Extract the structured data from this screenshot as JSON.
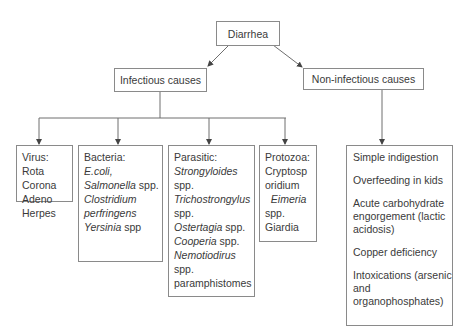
{
  "root": {
    "label": "Diarrhea"
  },
  "branches": {
    "infectious": {
      "label": "Infectious causes"
    },
    "non_infectious": {
      "label": "Non-infectious causes"
    }
  },
  "infectious_groups": {
    "virus": {
      "title": "Virus:",
      "items": [
        "Rota",
        "Corona",
        "Adeno",
        "Herpes"
      ]
    },
    "bacteria": {
      "title": "Bacteria:",
      "lines": [
        {
          "italic": "E.coli,",
          "plain": ""
        },
        {
          "italic": "Salmonella",
          "plain": " spp."
        },
        {
          "italic": "Clostridium",
          "plain": ""
        },
        {
          "italic": "perfringens",
          "plain": ""
        },
        {
          "italic": "Yersinia",
          "plain": " spp"
        }
      ]
    },
    "parasitic": {
      "title": "Parasitic:",
      "lines": [
        {
          "italic": "Strongyloides",
          "plain": ""
        },
        {
          "italic": "",
          "plain": "spp."
        },
        {
          "italic": "Trichostrongylus",
          "plain": ""
        },
        {
          "italic": "",
          "plain": "spp."
        },
        {
          "italic": "Ostertagia",
          "plain": " spp."
        },
        {
          "italic": "Cooperia",
          "plain": " spp."
        },
        {
          "italic": "Nemotiodirus",
          "plain": ""
        },
        {
          "italic": "",
          "plain": "spp."
        },
        {
          "italic": "",
          "plain": "paramphistomes"
        }
      ]
    },
    "protozoa": {
      "title": "Protozoa:",
      "lines": [
        {
          "italic": "",
          "plain": "Cryptosp"
        },
        {
          "italic": "",
          "plain": "oridium"
        },
        {
          "italic": "  Eimeria",
          "plain": ""
        },
        {
          "italic": "",
          "plain": "spp."
        },
        {
          "italic": "",
          "plain": "Giardia"
        }
      ]
    }
  },
  "non_infectious_items": [
    "Simple indigestion",
    "Overfeeding in kids",
    "Acute carbohydrate engorgement (lactic acidosis)",
    "Copper deficiency",
    "Intoxications (arsenic and organophosphates)"
  ],
  "colors": {
    "line": "#6e6e6e",
    "border": "#8a8a8a",
    "text": "#3a3a3a"
  }
}
